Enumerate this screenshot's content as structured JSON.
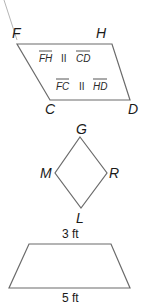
{
  "parallelogram": {
    "vertices": {
      "F": "F",
      "H": "H",
      "C": "C",
      "D": "D"
    },
    "relations": [
      {
        "left": "FH",
        "symbol": "II",
        "right": "CD"
      },
      {
        "left": "FC",
        "symbol": "II",
        "right": "HD"
      }
    ]
  },
  "rhombus": {
    "vertices": {
      "G": "G",
      "M": "M",
      "R": "R",
      "L": "L"
    }
  },
  "trapezoid": {
    "top_label": "3 ft",
    "bottom_label": "5 ft"
  },
  "colors": {
    "stroke": "#6b6b6b",
    "text": "#1a1a1a"
  }
}
